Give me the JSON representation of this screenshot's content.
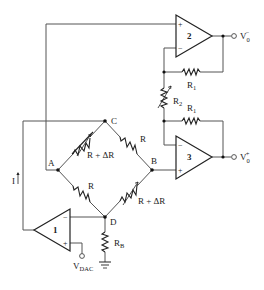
{
  "diagram": {
    "type": "circuit-schematic",
    "opamps": [
      {
        "id": "opamp1",
        "number": "1",
        "plus": "+",
        "minus": "−"
      },
      {
        "id": "opamp2",
        "number": "2",
        "plus": "+",
        "minus": "−"
      },
      {
        "id": "opamp3",
        "number": "3",
        "plus": "+",
        "minus": "−"
      }
    ],
    "bridge": {
      "nodes": {
        "A": "A",
        "B": "B",
        "C": "C",
        "D": "D"
      },
      "resistors": {
        "AC": "R + ΔR",
        "CB": "R",
        "AD": "R",
        "DB": "R + ΔR"
      }
    },
    "resistors": {
      "R1_top": {
        "main": "R",
        "sub": "1"
      },
      "R1_bottom": {
        "main": "R",
        "sub": "1"
      },
      "R2": {
        "main": "R",
        "sub": "2"
      },
      "RB": {
        "main": "R",
        "sub": "B"
      }
    },
    "current_label": "I",
    "outputs": {
      "v0_minus": {
        "main": "V",
        "sub": "0",
        "sup": "−"
      },
      "v0_plus": {
        "main": "V",
        "sub": "0",
        "sup": "+"
      }
    },
    "input": {
      "main": "V",
      "sub": "DAC"
    }
  }
}
